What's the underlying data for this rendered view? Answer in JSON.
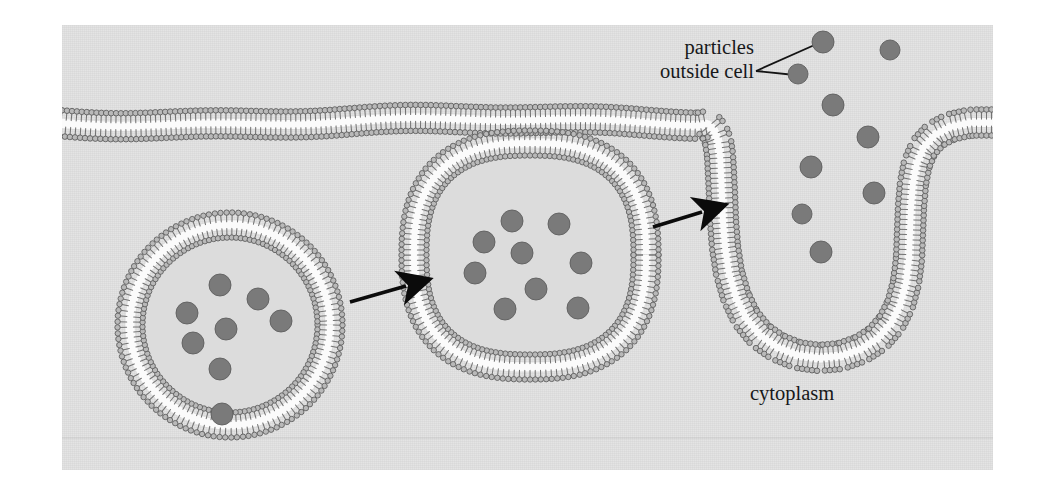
{
  "figure": {
    "background_color": "#e2e2e2",
    "page_background": "#ffffff",
    "labels": {
      "particles_outside_cell_line1": "particles",
      "particles_outside_cell_line2": "outside cell",
      "cytoplasm": "cytoplasm"
    },
    "colors": {
      "particle_fill": "#7a7a7a",
      "particle_stroke": "#5f5f5f",
      "lipid_head_fill": "#b9b9b9",
      "lipid_head_stroke": "#5a5a5a",
      "lipid_tail": "#6e6e6e",
      "bilayer_core": "#fbfbfb",
      "vesicle_lumen": "#dcdcdc",
      "arrow": "#0b0b0b",
      "leader_line": "#141414",
      "text": "#17181a"
    },
    "membrane": {
      "name": "plasma-membrane",
      "description": "phospholipid bilayer spanning the figure with an invagination on the right"
    },
    "arrows": [
      {
        "name": "arrow-vesicle-growth",
        "x1": 288,
        "y1": 277,
        "x2": 344,
        "y2": 261
      },
      {
        "name": "arrow-vesicle-pinch",
        "x1": 591,
        "y1": 202,
        "x2": 640,
        "y2": 187
      }
    ],
    "leader_lines": [
      {
        "name": "leader-to-particle-upper",
        "x1": 694,
        "y1": 46,
        "x2": 757,
        "y2": 18
      },
      {
        "name": "leader-to-particle-lower",
        "x1": 694,
        "y1": 46,
        "x2": 733,
        "y2": 50
      }
    ],
    "vesicles": [
      {
        "name": "vesicle-left-internalized",
        "cx": 168,
        "cy": 300,
        "rx": 100,
        "ry": 100,
        "shape": "circle",
        "particle_count": 8
      },
      {
        "name": "vesicle-middle-forming",
        "cx": 468,
        "cy": 230,
        "rx": 116,
        "ry": 112,
        "shape": "rounded-square",
        "particle_count": 9
      },
      {
        "name": "invagination-right",
        "shape": "membrane-pocket",
        "particle_count": 5
      }
    ],
    "particles": {
      "outside_cell": [
        {
          "cx": 761,
          "cy": 17,
          "r": 11
        },
        {
          "cx": 736,
          "cy": 49,
          "r": 10
        },
        {
          "cx": 828,
          "cy": 25,
          "r": 10
        },
        {
          "cx": 771,
          "cy": 80,
          "r": 11
        }
      ],
      "in_invagination": [
        {
          "cx": 806,
          "cy": 112,
          "r": 11
        },
        {
          "cx": 749,
          "cy": 142,
          "r": 11
        },
        {
          "cx": 812,
          "cy": 168,
          "r": 11
        },
        {
          "cx": 740,
          "cy": 189,
          "r": 10
        },
        {
          "cx": 759,
          "cy": 227,
          "r": 11
        }
      ],
      "vesicle_left": [
        {
          "cx": 158,
          "cy": 260,
          "r": 11
        },
        {
          "cx": 196,
          "cy": 274,
          "r": 11
        },
        {
          "cx": 125,
          "cy": 288,
          "r": 11
        },
        {
          "cx": 164,
          "cy": 304,
          "r": 11
        },
        {
          "cx": 219,
          "cy": 296,
          "r": 11
        },
        {
          "cx": 131,
          "cy": 318,
          "r": 11
        },
        {
          "cx": 158,
          "cy": 344,
          "r": 11
        },
        {
          "cx": 160,
          "cy": 389,
          "r": 11
        }
      ],
      "vesicle_middle": [
        {
          "cx": 450,
          "cy": 196,
          "r": 11
        },
        {
          "cx": 497,
          "cy": 199,
          "r": 11
        },
        {
          "cx": 422,
          "cy": 217,
          "r": 11
        },
        {
          "cx": 460,
          "cy": 228,
          "r": 11
        },
        {
          "cx": 519,
          "cy": 238,
          "r": 11
        },
        {
          "cx": 413,
          "cy": 248,
          "r": 11
        },
        {
          "cx": 474,
          "cy": 264,
          "r": 11
        },
        {
          "cx": 443,
          "cy": 284,
          "r": 11
        },
        {
          "cx": 516,
          "cy": 283,
          "r": 11
        }
      ]
    }
  }
}
